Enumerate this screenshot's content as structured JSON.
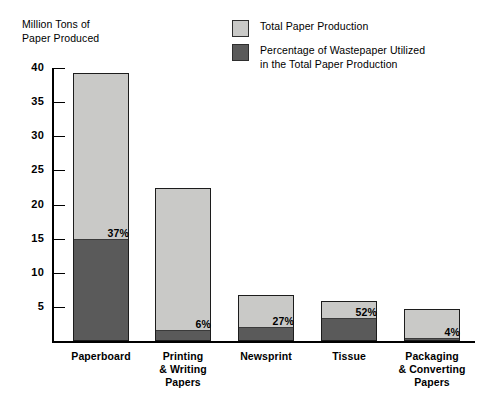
{
  "chart_data": {
    "type": "bar",
    "title": "",
    "ylabel": "Million Tons of\nPaper Produced",
    "xlabel": "",
    "ylim": [
      0,
      40
    ],
    "yticks": [
      40,
      35,
      30,
      25,
      20,
      15,
      10,
      5
    ],
    "ytick_labels": [
      "40",
      "35",
      "30",
      "25",
      "20",
      "15",
      "10",
      "5"
    ],
    "grid": false,
    "legend_position": "top-right",
    "categories": [
      "Paperboard",
      "Printing\n& Writing\nPapers",
      "Newsprint",
      "Tissue",
      "Packaging\n& Converting\nPapers"
    ],
    "series": [
      {
        "name": "Total Paper Production",
        "color": "#c9c9c7",
        "values": [
          39.3,
          22.4,
          6.7,
          5.9,
          4.7
        ]
      },
      {
        "name": "Percentage of Wastepaper Utilized\nin the Total Paper Production",
        "color": "#5a5a5a",
        "values": [
          14.6,
          1.35,
          1.8,
          3.1,
          0.19
        ]
      }
    ],
    "data_labels": [
      "37%",
      "6%",
      "27%",
      "52%",
      "4%"
    ],
    "annotations": []
  },
  "legend": {
    "items": [
      {
        "label": "Total Paper Production",
        "color": "#c9c9c7"
      },
      {
        "label": "Percentage of Wastepaper Utilized\nin the Total Paper Production",
        "color": "#5a5a5a"
      }
    ]
  },
  "axis": {
    "y_title": "Million Tons of\nPaper Produced",
    "y_ticks": [
      {
        "label": "40"
      },
      {
        "label": "35"
      },
      {
        "label": "30"
      },
      {
        "label": "25"
      },
      {
        "label": "20"
      },
      {
        "label": "15"
      },
      {
        "label": "10"
      },
      {
        "label": "5"
      }
    ]
  },
  "bars": [
    {
      "category": "Paperboard",
      "total": 39.3,
      "waste": 14.6,
      "pct_label": "37%"
    },
    {
      "category": "Printing\n& Writing\nPapers",
      "total": 22.4,
      "waste": 1.35,
      "pct_label": "6%"
    },
    {
      "category": "Newsprint",
      "total": 6.7,
      "waste": 1.8,
      "pct_label": "27%"
    },
    {
      "category": "Tissue",
      "total": 5.9,
      "waste": 3.1,
      "pct_label": "52%"
    },
    {
      "category": "Packaging\n& Converting\nPapers",
      "total": 4.7,
      "waste": 0.19,
      "pct_label": "4%"
    }
  ]
}
